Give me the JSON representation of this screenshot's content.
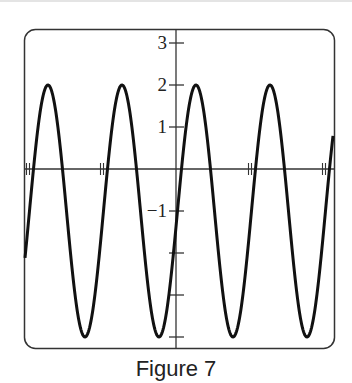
{
  "caption": "Figure 7",
  "chart_data": {
    "type": "line",
    "title": "",
    "xlabel": "",
    "ylabel": "",
    "function_description": "sinusoid y = -1 + 3 sin(2π(x - 0.02)) with x measured in x-tick units (one period per tick interval)",
    "amplitude": 3,
    "midline": -1,
    "max": 2,
    "min": -4,
    "period_ticks": 1,
    "phase_shift_ticks": 0.02,
    "xlim": [
      -2.07,
      2.13
    ],
    "ylim": [
      -4.2,
      3.3
    ],
    "x_ticks": [
      -2,
      -1,
      0,
      1,
      2
    ],
    "x_tick_labels": [
      "",
      "",
      "",
      "",
      ""
    ],
    "y_ticks": [
      3,
      2,
      1,
      -1,
      -2,
      -3,
      -4
    ],
    "y_tick_labels": [
      "3",
      "2",
      "1",
      "−1",
      "",
      "",
      ""
    ],
    "peaks_x": [
      -1.73,
      -0.73,
      0.27,
      1.27
    ],
    "troughs_x": [
      -1.23,
      -0.23,
      0.77,
      1.77
    ],
    "grid": false,
    "legend": null,
    "line_color": "#111111"
  }
}
